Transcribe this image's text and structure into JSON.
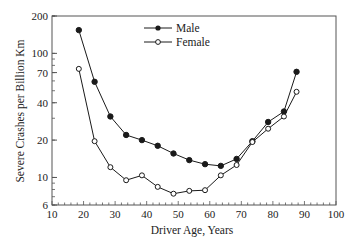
{
  "chart_data": {
    "type": "line",
    "title": "",
    "xlabel": "Driver Age, Years",
    "ylabel": "Severe Crashes per Billion Km",
    "xlim": [
      10,
      100
    ],
    "ylim": [
      6,
      200
    ],
    "yscale": "log",
    "x_ticks": [
      10,
      20,
      30,
      40,
      50,
      60,
      70,
      80,
      90,
      100
    ],
    "y_ticks": [
      6,
      10,
      20,
      40,
      70,
      100,
      200
    ],
    "grid": false,
    "legend_position": "upper center",
    "series": [
      {
        "name": "Male",
        "marker": "filled-circle",
        "x": [
          18.5,
          23.5,
          28.5,
          33.5,
          38.5,
          43.5,
          48.5,
          53.5,
          58.5,
          63.5,
          68.5,
          73.5,
          78.5,
          83.5,
          87.5
        ],
        "values": [
          154,
          59,
          31,
          22,
          20,
          18,
          15.6,
          13.8,
          12.8,
          12.4,
          14.1,
          19.6,
          28,
          34,
          71
        ]
      },
      {
        "name": "Female",
        "marker": "open-circle",
        "x": [
          18.5,
          23.5,
          28.5,
          33.5,
          38.5,
          43.5,
          48.5,
          53.5,
          58.5,
          63.5,
          68.5,
          73.5,
          78.5,
          83.5,
          87.5
        ],
        "values": [
          75,
          19.6,
          12.1,
          9.5,
          10.4,
          8.4,
          7.4,
          7.8,
          7.9,
          10.4,
          12.6,
          19.3,
          24.7,
          31,
          49
        ]
      }
    ]
  },
  "colors": {
    "line": "#1a1a1a",
    "axis": "#555555",
    "background": "#ffffff"
  }
}
